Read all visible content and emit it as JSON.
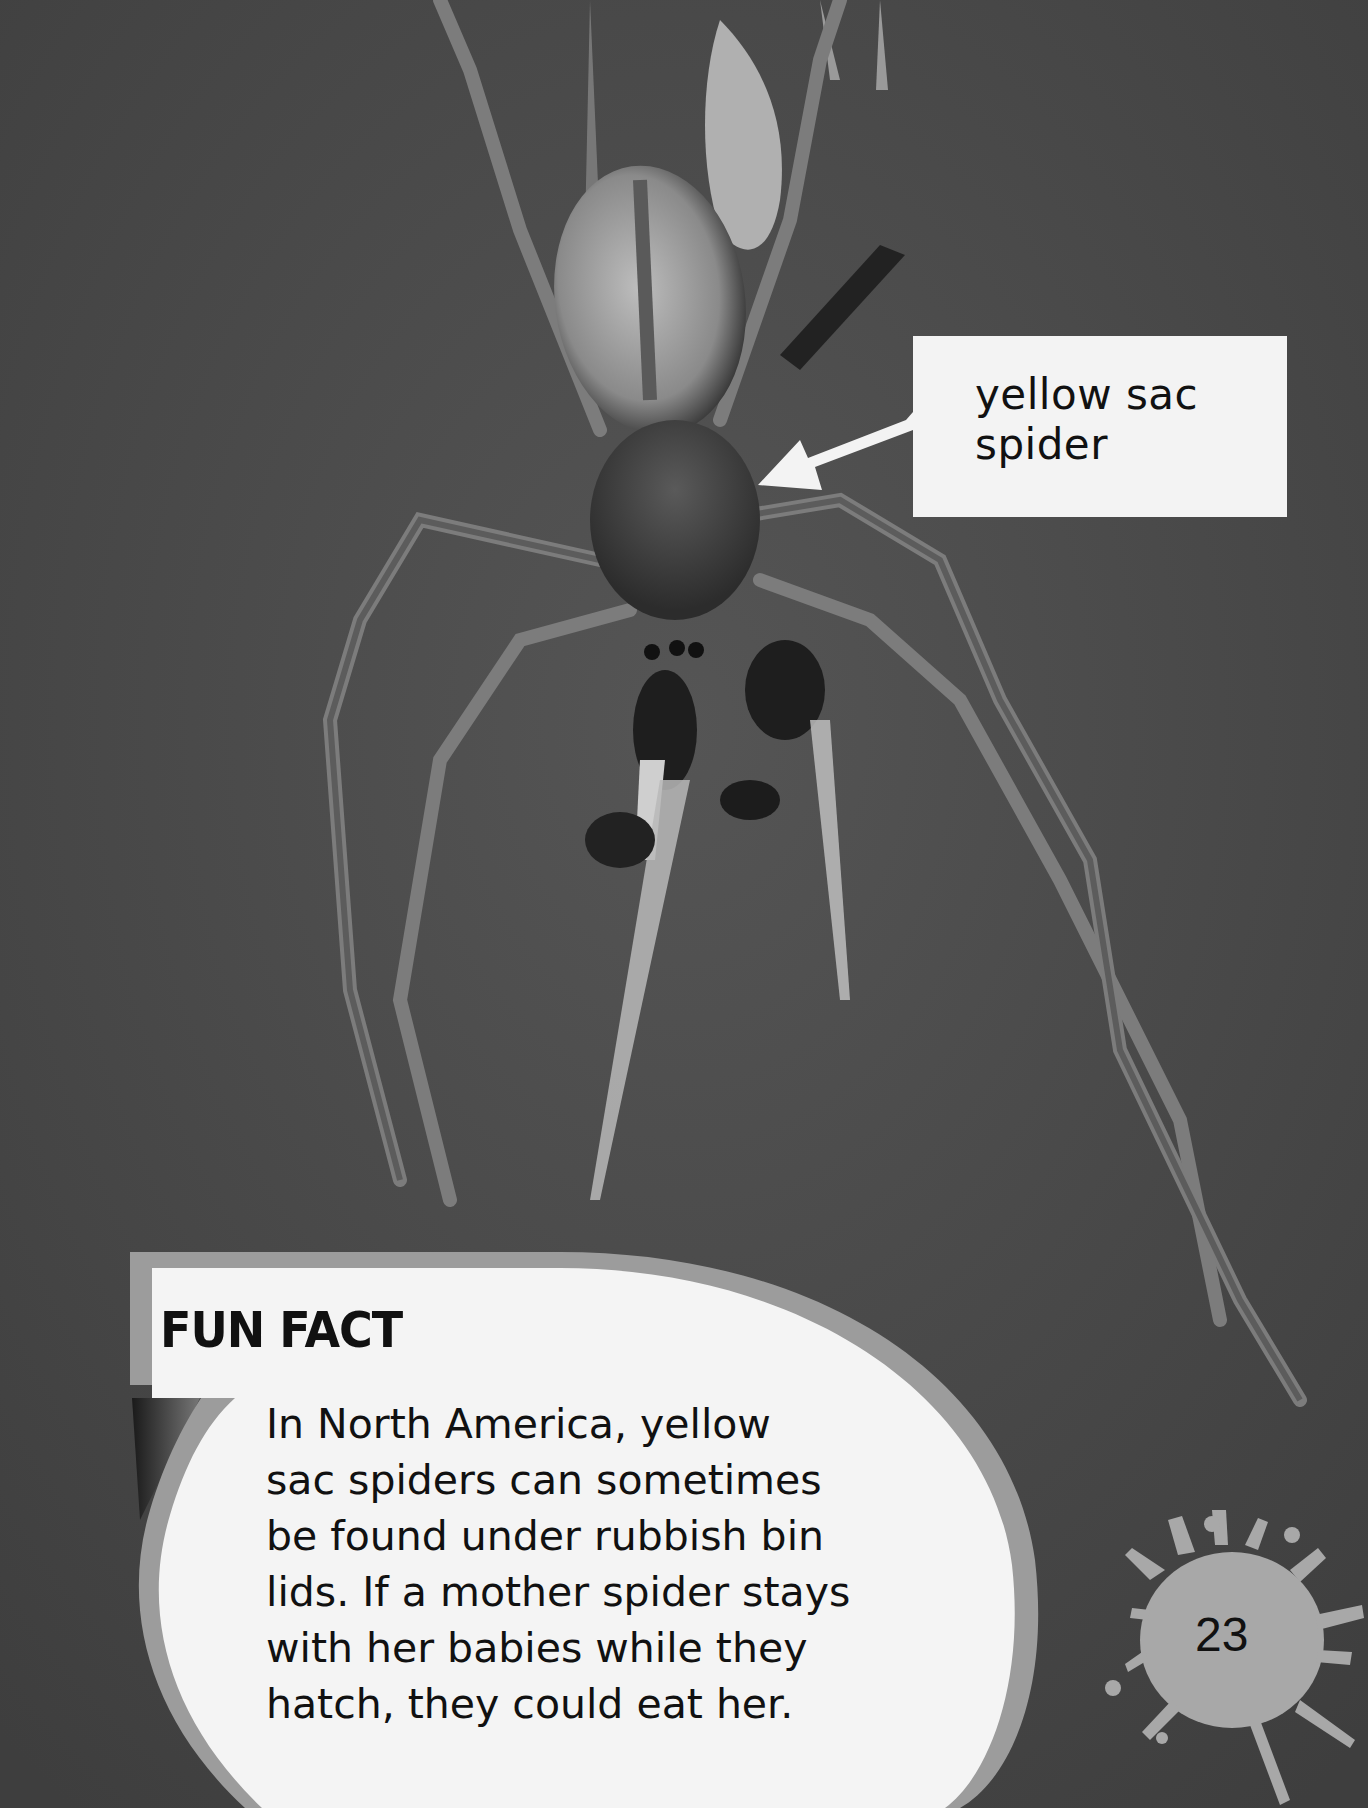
{
  "page": {
    "background_color": "#4a4a4a",
    "photo_subject": "spider-photo"
  },
  "label": {
    "line1": "yellow sac",
    "line2": "spider"
  },
  "fun_fact": {
    "title": "FUN FACT",
    "lines": [
      "In North America, yellow",
      "sac spiders can sometimes",
      "be found under rubbish bin",
      "lids. If a mother spider stays",
      "with her babies while they",
      "hatch, they could eat her."
    ]
  },
  "page_number": "23",
  "colors": {
    "bubble_fill": "#f4f4f4",
    "bubble_rim": "#9c9c9c",
    "splat": "#a8a8a8",
    "text": "#111111"
  }
}
